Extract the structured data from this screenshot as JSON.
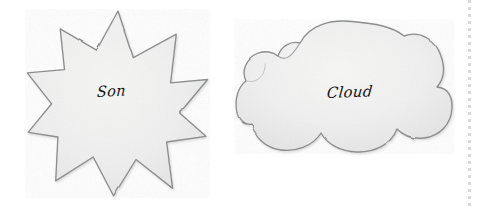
{
  "page": {
    "background_color": "#ffffff",
    "width": 480,
    "height": 210
  },
  "shapes": [
    {
      "id": "sun",
      "kind": "star",
      "points": 10,
      "label": "Son",
      "fill_color": "#eff0ef",
      "outline_color": "#8d8f90",
      "center_x": 118,
      "center_y": 103,
      "outer_radius": 92,
      "inner_radius": 58,
      "bounds": {
        "x": 27,
        "y": 10,
        "width": 181,
        "height": 186
      }
    },
    {
      "id": "cloud",
      "kind": "cloud",
      "label": "Cloud",
      "fill_color": "#eff0ef",
      "outline_color": "#8d8f90",
      "bounds": {
        "x": 236,
        "y": 21,
        "width": 216,
        "height": 132
      }
    }
  ],
  "perforation": {
    "label": "dotted tear line",
    "x": 468,
    "color": "#d9d9d9",
    "dash_length": 3,
    "gap_length": 4
  },
  "labels": {
    "sun_text": "Son",
    "cloud_text": "Cloud"
  }
}
